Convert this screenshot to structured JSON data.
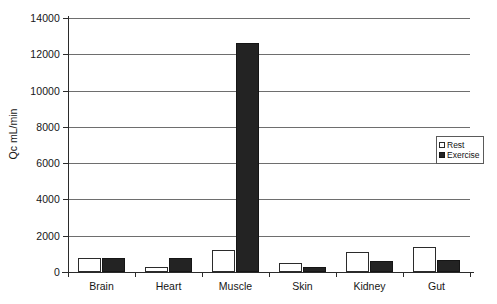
{
  "chart_data": {
    "type": "bar",
    "title": "",
    "subtitle": "",
    "xlabel": "",
    "ylabel": "Qc mL/min",
    "ylim": [
      0,
      14000
    ],
    "ytick_step": 2000,
    "yticks": [
      "0",
      "2000",
      "4000",
      "6000",
      "8000",
      "10000",
      "12000",
      "14000"
    ],
    "grid": true,
    "grid_orientation": "horizontal",
    "legend_position": "right",
    "categories": [
      "Brain",
      "Heart",
      "Muscle",
      "Skin",
      "Kidney",
      "Gut"
    ],
    "series": [
      {
        "name": "Rest",
        "style": "open",
        "color": "#ffffff",
        "values": [
          750,
          250,
          1200,
          500,
          1100,
          1400
        ]
      },
      {
        "name": "Exercise",
        "style": "filled",
        "color": "#232323",
        "values": [
          750,
          750,
          12600,
          300,
          600,
          650
        ]
      }
    ]
  },
  "legend": {
    "items": [
      {
        "label": "Rest",
        "swatch": "open-square-swatch"
      },
      {
        "label": "Exercise",
        "swatch": "filled-square-swatch"
      }
    ]
  },
  "axes": {
    "y_title": "Qc mL/min"
  }
}
